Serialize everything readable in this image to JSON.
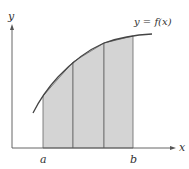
{
  "diagram": {
    "type": "trapezoidal-rule-approximation",
    "colors": {
      "background": "#ffffff",
      "axis": "#555555",
      "curve": "#444444",
      "shading": "#d4d4d4",
      "trapezoid_edge": "#666666",
      "label": "#333333"
    },
    "axes": {
      "x_label": "x",
      "y_label": "y"
    },
    "curve_label": "y = f(x)",
    "ticks": [
      {
        "label": "a"
      },
      {
        "label": "b"
      }
    ],
    "trapezoids": {
      "count": 3
    }
  }
}
